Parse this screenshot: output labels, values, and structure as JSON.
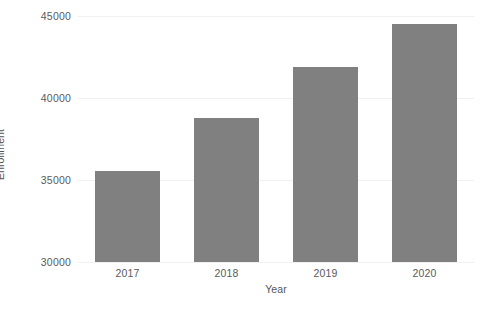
{
  "chart_data": {
    "type": "bar",
    "title": "",
    "subtitle": "",
    "xlabel": "Year",
    "ylabel": "Enrollment",
    "categories": [
      "2017",
      "2018",
      "2019",
      "2020"
    ],
    "values": [
      35550,
      38800,
      41900,
      44500
    ],
    "series": [
      {
        "name": "Enrollment",
        "values": [
          35550,
          38800,
          41900,
          44500
        ]
      }
    ],
    "ylim": [
      30000,
      45000
    ],
    "yticks": [
      30000,
      35000,
      40000,
      45000
    ],
    "ytick_labels": [
      "30000",
      "35000",
      "40000",
      "45000"
    ],
    "xtick_labels": [
      "2017",
      "2018",
      "2019",
      "2020"
    ],
    "grid": true,
    "grid_axis": "y",
    "legend": false,
    "legend_position": "none",
    "bar_color": "#808080",
    "background_color": "#ffffff",
    "gridline_color": "#f0f0f0",
    "tick_text_color": "#5a5a5a",
    "axis_title_color": "#555555",
    "data_labels": false,
    "axis_line": false,
    "plot_border": false,
    "annotations": []
  }
}
